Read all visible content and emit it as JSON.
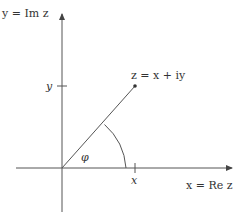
{
  "diagram": {
    "y_axis_label": "y = Im z",
    "x_axis_label": "x = Re z",
    "point_label": "z = x + iy",
    "angle_label": "φ",
    "x_tick_label": "x",
    "y_tick_label": "y",
    "colors": {
      "stroke": "#444444",
      "text": "#333333"
    }
  }
}
